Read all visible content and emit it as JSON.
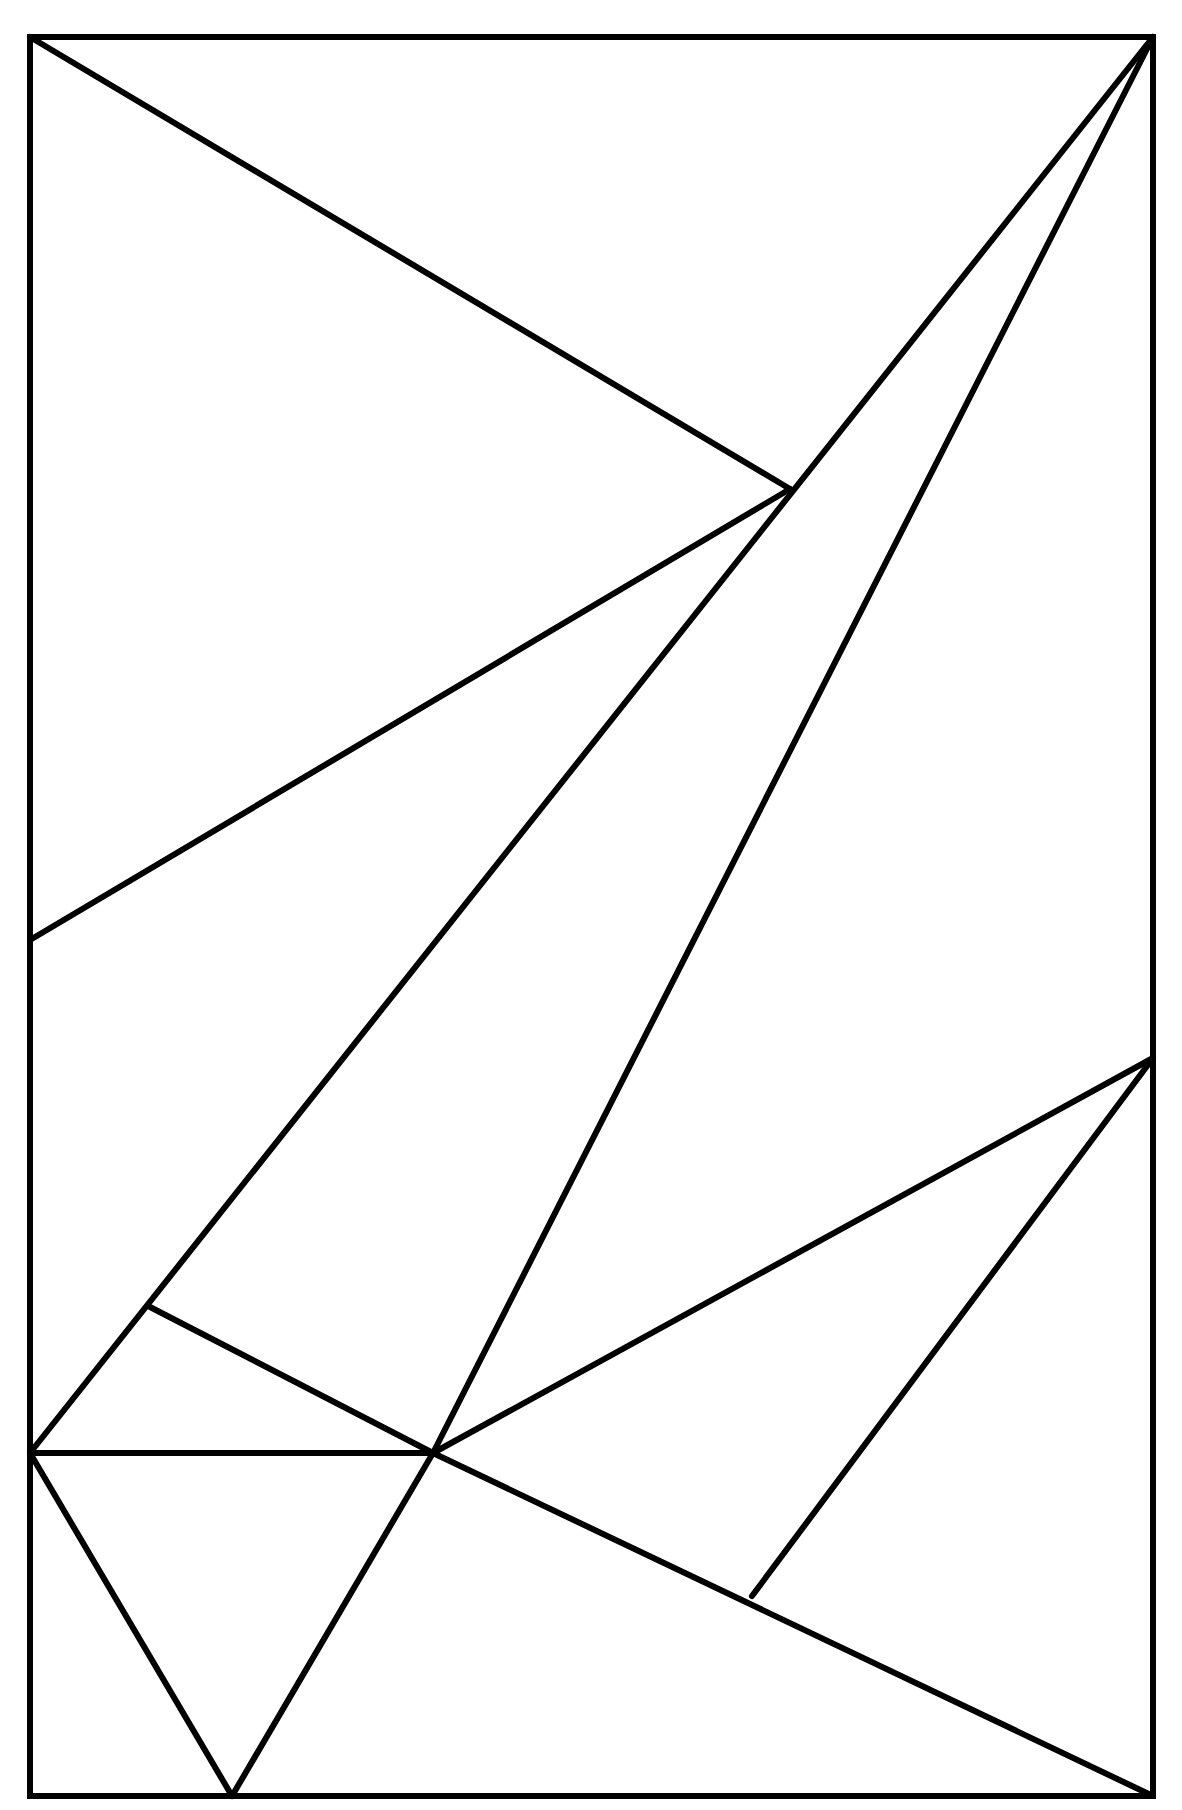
{
  "diagram": {
    "type": "geometric-line-dissection",
    "stroke_color": "#000000",
    "background_color": "#ffffff",
    "stroke_width": 6,
    "points": {
      "TL": [
        30,
        37
      ],
      "TR": [
        1153,
        37
      ],
      "BR": [
        1153,
        1796
      ],
      "BL": [
        30,
        1796
      ],
      "P": [
        790,
        489
      ],
      "L": [
        30,
        940
      ],
      "R": [
        1153,
        1058
      ],
      "Q": [
        150,
        1307
      ],
      "C": [
        433,
        1453
      ],
      "K": [
        30,
        1453
      ],
      "M": [
        752,
        1596
      ],
      "B": [
        232,
        1796
      ]
    },
    "segments": [
      [
        "TL",
        "P"
      ],
      [
        "P",
        "L"
      ],
      [
        "TR",
        "K"
      ],
      [
        "TR",
        "C"
      ],
      [
        "Q",
        "C"
      ],
      [
        "K",
        "C"
      ],
      [
        "C",
        "R"
      ],
      [
        "R",
        "M"
      ],
      [
        "C",
        "BR"
      ],
      [
        "K",
        "B"
      ],
      [
        "B",
        "C"
      ]
    ]
  }
}
